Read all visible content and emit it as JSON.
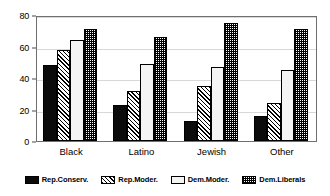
{
  "chart_data": {
    "type": "bar",
    "title": "",
    "subtitle": "",
    "xlabel": "",
    "ylabel": "",
    "ylim": [
      0,
      80
    ],
    "yticks": [
      0,
      20,
      40,
      60,
      80
    ],
    "grid": true,
    "legend_position": "bottom",
    "categories": [
      "Black",
      "Latino",
      "Jewish",
      "Other"
    ],
    "series": [
      {
        "name": "Rep.Conserv.",
        "pattern": "solid",
        "values": [
          48,
          23,
          13,
          16
        ]
      },
      {
        "name": "Rep.Moder.",
        "pattern": "hatch",
        "values": [
          58,
          32,
          35,
          24
        ]
      },
      {
        "name": "Dem.Moder.",
        "pattern": "light",
        "values": [
          64,
          49,
          47,
          45
        ]
      },
      {
        "name": "Dem.Liberals",
        "pattern": "check",
        "values": [
          71,
          66,
          75,
          71
        ]
      }
    ]
  },
  "axis": {
    "y_tick_labels": [
      "0",
      "20",
      "40",
      "60",
      "80"
    ],
    "x_tick_labels": [
      "Black",
      "Latino",
      "Jewish",
      "Other"
    ]
  },
  "legend": {
    "items": [
      {
        "label": "Rep.Conserv."
      },
      {
        "label": "Rep.Moder."
      },
      {
        "label": "Dem.Moder."
      },
      {
        "label": "Dem.Liberals"
      }
    ]
  },
  "colors": {
    "background": "#ffffff",
    "axis": "#6f6f6f",
    "grid": "#d8d8d8",
    "ink": "#000000"
  }
}
